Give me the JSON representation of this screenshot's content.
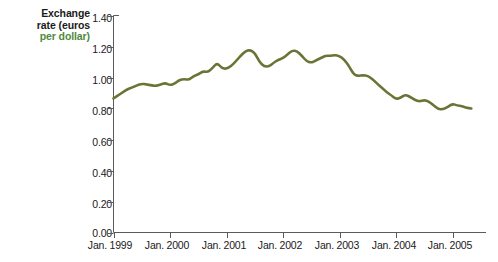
{
  "chart_data": {
    "type": "line",
    "title": "",
    "xlabel": "",
    "ylabel": "Exchange rate (euros per dollar)",
    "ylabel_lines": [
      "Exchange",
      "rate (euros",
      "per dollar)"
    ],
    "ylabel_highlight_word": "per dollar)",
    "series_color": "#6b7436",
    "grid": false,
    "legend": "none",
    "ylim": [
      0.0,
      1.4
    ],
    "yticks": [
      0.0,
      0.2,
      0.4,
      0.6,
      0.8,
      1.0,
      1.2,
      1.4
    ],
    "ytick_labels": [
      "0.00",
      "0.20",
      "0.40",
      "0.60",
      "0.80",
      "1.00",
      "1.20",
      "1.40"
    ],
    "xlim": [
      "1999-01",
      "2005-05"
    ],
    "xticks": [
      "1999-01",
      "2000-01",
      "2001-01",
      "2002-01",
      "2003-01",
      "2004-01",
      "2005-01"
    ],
    "xtick_labels": [
      "Jan. 1999",
      "Jan. 2000",
      "Jan. 2001",
      "Jan. 2002",
      "Jan. 2003",
      "Jan. 2004",
      "Jan. 2005"
    ],
    "x": [
      "1999-01",
      "1999-02",
      "1999-03",
      "1999-04",
      "1999-05",
      "1999-06",
      "1999-07",
      "1999-08",
      "1999-09",
      "1999-10",
      "1999-11",
      "1999-12",
      "2000-01",
      "2000-02",
      "2000-03",
      "2000-04",
      "2000-05",
      "2000-06",
      "2000-07",
      "2000-08",
      "2000-09",
      "2000-10",
      "2000-11",
      "2000-12",
      "2001-01",
      "2001-02",
      "2001-03",
      "2001-04",
      "2001-05",
      "2001-06",
      "2001-07",
      "2001-08",
      "2001-09",
      "2001-10",
      "2001-11",
      "2001-12",
      "2002-01",
      "2002-02",
      "2002-03",
      "2002-04",
      "2002-05",
      "2002-06",
      "2002-07",
      "2002-08",
      "2002-09",
      "2002-10",
      "2002-11",
      "2002-12",
      "2003-01",
      "2003-02",
      "2003-03",
      "2003-04",
      "2003-05",
      "2003-06",
      "2003-07",
      "2003-08",
      "2003-09",
      "2003-10",
      "2003-11",
      "2003-12",
      "2004-01",
      "2004-02",
      "2004-03",
      "2004-04",
      "2004-05",
      "2004-06",
      "2004-07",
      "2004-08",
      "2004-09",
      "2004-10",
      "2004-11",
      "2004-12",
      "2005-01",
      "2005-02",
      "2005-03",
      "2005-04",
      "2005-05"
    ],
    "values": [
      0.865,
      0.885,
      0.905,
      0.925,
      0.935,
      0.95,
      0.96,
      0.955,
      0.95,
      0.945,
      0.955,
      0.965,
      0.95,
      0.96,
      0.985,
      0.99,
      0.985,
      1.01,
      1.02,
      1.04,
      1.035,
      1.06,
      1.095,
      1.06,
      1.055,
      1.075,
      1.105,
      1.14,
      1.17,
      1.178,
      1.16,
      1.1,
      1.072,
      1.07,
      1.095,
      1.115,
      1.125,
      1.15,
      1.175,
      1.17,
      1.14,
      1.105,
      1.095,
      1.11,
      1.125,
      1.14,
      1.14,
      1.145,
      1.14,
      1.115,
      1.075,
      1.02,
      1.01,
      1.015,
      1.01,
      0.99,
      0.96,
      0.935,
      0.905,
      0.885,
      0.86,
      0.87,
      0.89,
      0.875,
      0.855,
      0.845,
      0.855,
      0.845,
      0.82,
      0.795,
      0.795,
      0.81,
      0.83,
      0.82,
      0.815,
      0.805,
      0.8
    ],
    "summary": {
      "start_value": 0.865,
      "end_value": 0.825,
      "max_value": 1.178,
      "max_at": "2001-06",
      "min_value": 0.745,
      "min_at": "2005-01"
    }
  }
}
